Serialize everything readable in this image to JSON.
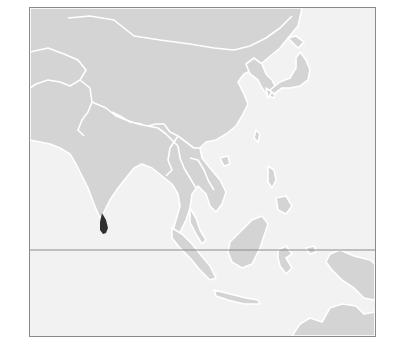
{
  "map": {
    "title": "Sri Lanka locator map",
    "region": "Asia",
    "highlighted_country": "Sri Lanka",
    "colors": {
      "ocean": "#f2f2f2",
      "land": "#d4d4d4",
      "borders": "#ffffff",
      "highlight": "#2f2f2f",
      "frame": "#8a8a8a",
      "equator": "#8c8c8c"
    },
    "reference_lines": [
      {
        "name": "Equator"
      }
    ]
  }
}
